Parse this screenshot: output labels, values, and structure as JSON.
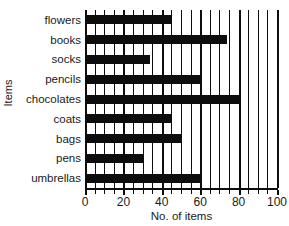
{
  "chart_data": {
    "type": "bar",
    "orientation": "horizontal",
    "title": "",
    "xlabel": "No. of items",
    "ylabel": "Items",
    "categories": [
      "flowers",
      "books",
      "socks",
      "pencils",
      "chocolates",
      "coats",
      "bags",
      "pens",
      "umbrellas"
    ],
    "values": [
      45,
      74,
      34,
      60,
      80,
      45,
      50,
      30,
      60
    ],
    "xlim": [
      0,
      100
    ],
    "xticks": [
      0,
      20,
      40,
      60,
      80,
      100
    ],
    "xtick_labels": [
      "0",
      "20",
      "40",
      "60",
      "80",
      "100"
    ],
    "minor_tick_step": 5,
    "grid": true,
    "grid_axis": "x",
    "legend": false,
    "bar_color": "#0d0d0d",
    "background_color": "#ffffff"
  },
  "axes": {
    "x_title": "No. of items",
    "y_title": "Items"
  }
}
